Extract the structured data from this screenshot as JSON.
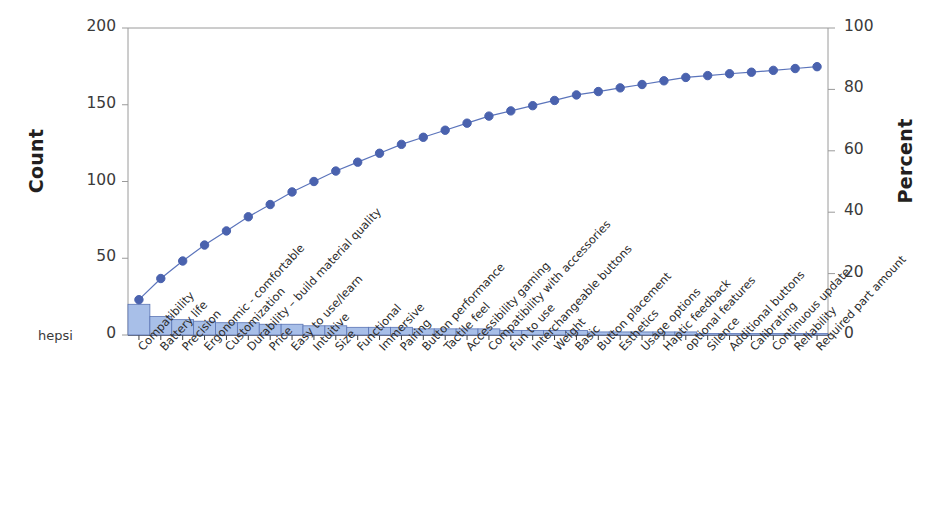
{
  "axes": {
    "y_left_title": "Count",
    "y_right_title": "Percent",
    "y_left_ticks": [
      "0",
      "50",
      "100",
      "150",
      "200"
    ],
    "y_right_ticks": [
      "0",
      "20",
      "40",
      "60",
      "80",
      "100"
    ],
    "corner_note": "hepsi"
  },
  "colors": {
    "bar_fill": "#a8bfe8",
    "bar_stroke": "#5a74b4",
    "line": "#5b74bb",
    "marker": "#4a62ae",
    "frame": "#9a9a9a",
    "text": "#231f20"
  },
  "chart_data": {
    "type": "bar",
    "title": "",
    "xlabel": "",
    "ylabel": "Count",
    "ylabel2": "Percent",
    "ylim": [
      0,
      200
    ],
    "ylim2": [
      0,
      100
    ],
    "grid": false,
    "legend": "none",
    "categories": [
      "Compatibility",
      "Battery life",
      "Precision",
      "Ergonomic - comfortable",
      "Customization",
      "Durability – build material quality",
      "Price",
      "Easy to use/learn",
      "Intuitive",
      "Size",
      "Functional",
      "Immersive",
      "Pairing",
      "Button performance",
      "Tactile feel",
      "Accessibility gaming",
      "Compatibility with accessories",
      "Fun to use",
      "Interchangeable buttons",
      "Weight",
      "Basic",
      "Button placement",
      "Esthetics",
      "Usage options",
      "Haptic feedback",
      "optional features",
      "Silence",
      "Additional buttons",
      "Calibrating",
      "Continuous update",
      "Reliability",
      "Required part amount"
    ],
    "values": [
      20,
      12,
      10,
      9,
      8,
      8,
      7,
      7,
      6,
      6,
      5,
      5,
      5,
      4,
      4,
      4,
      4,
      3,
      3,
      3,
      3,
      2,
      2,
      2,
      2,
      2,
      1,
      1,
      1,
      1,
      1,
      1
    ],
    "cumulative_percent": [
      11.5,
      18.4,
      24.1,
      29.3,
      33.9,
      38.5,
      42.5,
      46.6,
      50.0,
      53.4,
      56.3,
      59.2,
      62.1,
      64.4,
      66.7,
      69.0,
      71.3,
      73.0,
      74.7,
      76.4,
      78.2,
      79.3,
      80.5,
      81.6,
      82.8,
      83.9,
      84.5,
      85.1,
      85.6,
      86.2,
      86.8,
      87.4
    ],
    "series": [
      {
        "name": "Count",
        "type": "bar",
        "axis": "left"
      },
      {
        "name": "Cumulative Percent",
        "type": "line",
        "axis": "right"
      }
    ]
  }
}
